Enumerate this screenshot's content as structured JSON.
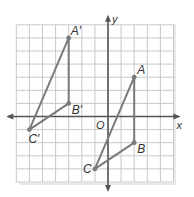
{
  "figure": {
    "type": "coordinate-grid-translation",
    "grid": {
      "x_min": -7,
      "x_max": 5,
      "y_min": -5,
      "y_max": 7,
      "origin_px": [
        108,
        116.5
      ],
      "unit_px": 13.1
    },
    "axes": {
      "x_label": "x",
      "y_label": "y",
      "origin_label": "O"
    },
    "triangles": [
      {
        "name": "ABC",
        "vertices": [
          {
            "label": "A",
            "x": 2,
            "y": 3
          },
          {
            "label": "B",
            "x": 2,
            "y": -2
          },
          {
            "label": "C",
            "x": -1,
            "y": -4
          }
        ]
      },
      {
        "name": "A'B'C'",
        "vertices": [
          {
            "label": "A′",
            "x": -3,
            "y": 6
          },
          {
            "label": "B′",
            "x": -3,
            "y": 1
          },
          {
            "label": "C′",
            "x": -6,
            "y": -1
          }
        ]
      }
    ],
    "colors": {
      "grid": "#c8c8c8",
      "axis": "#555555",
      "triangle": "#7a7a7a",
      "shadow": "#e6e6e6"
    }
  }
}
